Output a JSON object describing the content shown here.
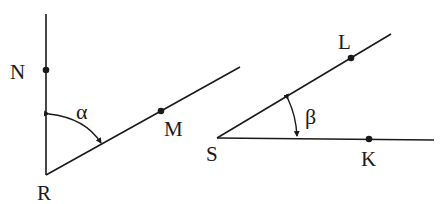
{
  "figures": {
    "left": {
      "vertex": {
        "label": "R",
        "x": 46,
        "y": 175
      },
      "rays": [
        {
          "name": "RN",
          "x2": 46,
          "y2": 14
        },
        {
          "name": "RM",
          "x2": 240,
          "y2": 67
        }
      ],
      "points": [
        {
          "label": "N",
          "x": 46,
          "y": 70
        },
        {
          "label": "M",
          "x": 161,
          "y": 111
        }
      ],
      "angle": {
        "symbol": "α"
      }
    },
    "right": {
      "vertex": {
        "label": "S",
        "x": 217,
        "y": 138
      },
      "rays": [
        {
          "name": "SL",
          "x2": 391,
          "y2": 34
        },
        {
          "name": "SK",
          "x2": 434,
          "y2": 140
        }
      ],
      "points": [
        {
          "label": "L",
          "x": 351,
          "y": 58
        },
        {
          "label": "K",
          "x": 369,
          "y": 139
        }
      ],
      "angle": {
        "symbol": "β"
      }
    }
  },
  "colors": {
    "stroke": "#1a1a1a",
    "background": "#ffffff"
  }
}
